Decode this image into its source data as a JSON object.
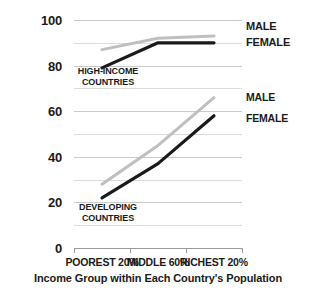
{
  "chart_data": {
    "type": "line",
    "title": "",
    "xlabel": "Income Group within Each Country's Population",
    "ylabel": "",
    "categories": [
      "POOREST 20%",
      "MIDDLE 60%",
      "RICHEST 20%"
    ],
    "ylim": [
      0,
      100
    ],
    "yticks": [
      0,
      20,
      40,
      60,
      80,
      100
    ],
    "ytick_labels": [
      "0",
      "20",
      "40",
      "60",
      "80",
      "100"
    ],
    "minor_gridlines": [
      10,
      30,
      50,
      70,
      90
    ],
    "grid": true,
    "legend_position": "right-inline",
    "series": [
      {
        "name": "MALE",
        "group": "HIGH-INCOME COUNTRIES",
        "color": "#bfbfbf",
        "values": [
          87,
          92,
          93
        ]
      },
      {
        "name": "FEMALE",
        "group": "HIGH-INCOME COUNTRIES",
        "color": "#1a1a1a",
        "values": [
          79,
          90,
          90
        ]
      },
      {
        "name": "MALE",
        "group": "DEVELOPING COUNTRIES",
        "color": "#bfbfbf",
        "values": [
          28,
          45,
          66
        ]
      },
      {
        "name": "FEMALE",
        "group": "DEVELOPING COUNTRIES",
        "color": "#1a1a1a",
        "values": [
          22,
          37,
          58
        ]
      }
    ],
    "annotations": [
      {
        "text_line1": "HIGH-INCOME",
        "text_line2": "COUNTRIES"
      },
      {
        "text_line1": "DEVELOPING",
        "text_line2": "COUNTRIES"
      }
    ],
    "legend_entries": [
      {
        "label": "MALE",
        "color": "#bfbfbf"
      },
      {
        "label": "FEMALE",
        "color": "#1a1a1a"
      },
      {
        "label": "MALE",
        "color": "#bfbfbf"
      },
      {
        "label": "FEMALE",
        "color": "#1a1a1a"
      }
    ]
  }
}
